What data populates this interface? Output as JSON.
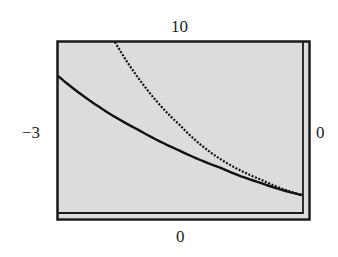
{
  "chart_data": {
    "type": "line",
    "title": "",
    "xlabel": "",
    "ylabel": "",
    "window": {
      "xmin": -3,
      "xmax": 0,
      "ymin": 0,
      "ymax": 10
    },
    "xlim": [
      -3,
      0
    ],
    "ylim": [
      0,
      10
    ],
    "grid": false,
    "legend": null,
    "tick_labels": {
      "xmin": "−3",
      "xmax": "0",
      "ymin": "0",
      "ymax": "10"
    },
    "series": [
      {
        "name": "steep curve",
        "style": "dotted",
        "x": [
          -2.3,
          -2.0,
          -1.5,
          -1.0,
          -0.5,
          0
        ],
        "y": [
          10,
          7.8,
          5.1,
          3.1,
          1.9,
          1.0
        ]
      },
      {
        "name": "shallow curve",
        "style": "solid",
        "x": [
          -3.0,
          -2.5,
          -2.0,
          -1.5,
          -1.0,
          -0.5,
          0
        ],
        "y": [
          8.0,
          6.2,
          4.8,
          3.6,
          2.6,
          1.7,
          1.0
        ]
      }
    ],
    "colors": {
      "plot_background": "#dcdcdc",
      "frame": "#1a1a1a",
      "curve": "#111111"
    }
  }
}
